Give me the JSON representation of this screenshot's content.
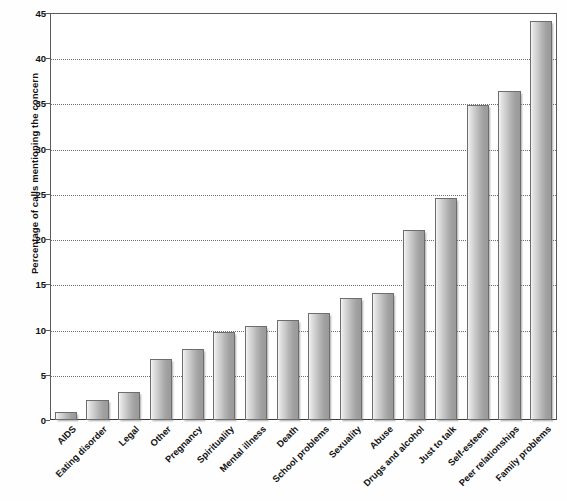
{
  "chart_data": {
    "type": "bar",
    "title": "",
    "xlabel": "",
    "ylabel": "Percentage of calls mentioning the concern",
    "ylim": [
      0,
      45
    ],
    "ytick_step": 5,
    "yticks": [
      0,
      5,
      10,
      15,
      20,
      25,
      30,
      35,
      40,
      45
    ],
    "grid": true,
    "legend": false,
    "categories": [
      "AIDS",
      "Eating disorder",
      "Legal",
      "Other",
      "Pregnancy",
      "Spirituality",
      "Mental illness",
      "Death",
      "School problems",
      "Sexuality",
      "Abuse",
      "Drugs and alcohol",
      "Just to talk",
      "Self-esteem",
      "Peer relationships",
      "Family problems"
    ],
    "values": [
      0.9,
      2.2,
      3.1,
      6.8,
      7.9,
      9.7,
      10.4,
      11.1,
      11.8,
      13.5,
      14.0,
      21.0,
      24.6,
      34.8,
      36.4,
      44.1
    ],
    "bar_color": "#b4b4b4",
    "bar_edge_color": "#6d6d6d",
    "axis_color": "#5a5a5a",
    "gridline_color": "#6e6e6e",
    "text_color": "#111111"
  }
}
